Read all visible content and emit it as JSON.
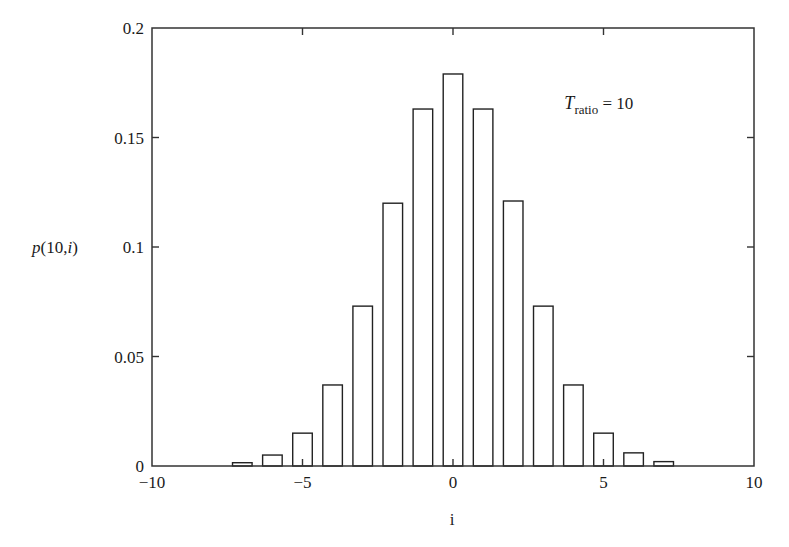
{
  "chart_data": {
    "type": "bar",
    "title": "",
    "xlabel": "i",
    "ylabel": "p(10,i)",
    "xlim": [
      -10,
      10
    ],
    "ylim": [
      0,
      0.2
    ],
    "grid": false,
    "bar_width": 0.65,
    "annotation": {
      "text_main": "T",
      "text_sub": "ratio",
      "text_rest": " = 10",
      "x": 3.7,
      "y": 0.163
    },
    "x": [
      -7,
      -6,
      -5,
      -4,
      -3,
      -2,
      -1,
      0,
      1,
      2,
      3,
      4,
      5,
      6,
      7
    ],
    "values": [
      0.0015,
      0.005,
      0.015,
      0.037,
      0.073,
      0.12,
      0.163,
      0.179,
      0.163,
      0.121,
      0.073,
      0.037,
      0.015,
      0.006,
      0.002
    ],
    "xticks": [
      -10,
      -5,
      0,
      5,
      10
    ],
    "xtick_labels": [
      "−10",
      "−5",
      "0",
      "5",
      "10"
    ],
    "yticks": [
      0,
      0.05,
      0.1,
      0.15,
      0.2
    ],
    "ytick_labels": [
      "0",
      "0.05",
      "0.1",
      "0.15",
      "0.2"
    ]
  },
  "colors": {
    "axis": "#333333",
    "bar_fill": "#ffffff",
    "bar_edge": "#222222",
    "text": "#1a1a1a"
  }
}
